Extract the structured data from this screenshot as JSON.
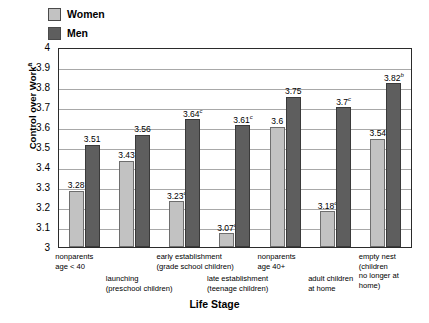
{
  "legend": {
    "items": [
      {
        "label": "Women",
        "color": "#c2c2c2",
        "name": "women"
      },
      {
        "label": "Men",
        "color": "#5e5e5e",
        "name": "men"
      }
    ]
  },
  "axes": {
    "ylabel_text": "Control over Work",
    "ylabel_sup": "a",
    "xlabel": "Life Stage",
    "yticks": [
      "4",
      "3.9",
      "3.8",
      "3.7",
      "3.6",
      "3.5",
      "3.4",
      "3.3",
      "3.2",
      "3.1",
      "3"
    ]
  },
  "chart_data": {
    "type": "bar",
    "title": "",
    "xlabel": "Life Stage",
    "ylabel": "Control over Work",
    "ylabel_footnote": "a",
    "ylim": [
      3,
      4
    ],
    "ytick_step": 0.1,
    "grid": true,
    "legend_position": "top-left",
    "categories": [
      "nonparents age < 40",
      "launching (preschool children)",
      "early establishment (grade school children)",
      "late establishment (teenage children)",
      "nonparents age 40+",
      "adult children at home",
      "empty nest (children no longer at home)"
    ],
    "series": [
      {
        "name": "Women",
        "color": "#c2c2c2",
        "values": [
          3.28,
          3.43,
          3.23,
          3.07,
          3.6,
          3.18,
          3.54
        ],
        "labels": [
          "3.28",
          "3.43",
          "3.23",
          "3.07",
          "3.6",
          "3.18",
          "3.54"
        ],
        "footnotes": [
          "",
          "",
          "c",
          "c",
          "",
          "c",
          ""
        ]
      },
      {
        "name": "Men",
        "color": "#5e5e5e",
        "values": [
          3.51,
          3.56,
          3.64,
          3.61,
          3.75,
          3.7,
          3.82
        ],
        "labels": [
          "3.51",
          "3.56",
          "3.64",
          "3.61",
          "3.75",
          "3.7",
          "3.82"
        ],
        "footnotes": [
          "",
          "",
          "c",
          "c",
          "",
          "c",
          "b"
        ]
      }
    ]
  },
  "category_labels": [
    {
      "line1": "nonparents",
      "line2": "age < 40",
      "row": "top"
    },
    {
      "line1": "launching",
      "line2": "(preschool children)",
      "row": "bottom"
    },
    {
      "line1": "early establishment",
      "line2": "(grade school children)",
      "row": "top"
    },
    {
      "line1": "late establishment",
      "line2": "(teenage children)",
      "row": "bottom"
    },
    {
      "line1": "nonparents",
      "line2": "age 40+",
      "row": "top"
    },
    {
      "line1": "adult children",
      "line2": "at home",
      "row": "bottom"
    },
    {
      "line1": "empty nest (children",
      "line2": "no longer at home)",
      "row": "top"
    }
  ]
}
